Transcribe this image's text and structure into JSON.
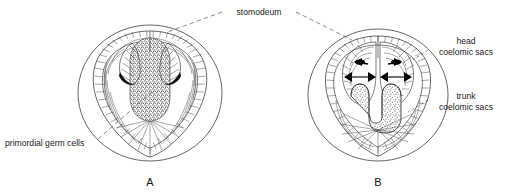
{
  "figure": {
    "background_color": "#ffffff",
    "ink_color": "#2b2b2b"
  },
  "labels": {
    "stomodeum": "stomodeum",
    "primordial_germ_cells": "primordial germ cells",
    "head_coelomic_sacs_line1": "head",
    "head_coelomic_sacs_line2": "coelomic sacs",
    "trunk_coelomic_sacs_line1": "trunk",
    "trunk_coelomic_sacs_line2": "coelomic sacs"
  },
  "panels": [
    {
      "id": "A",
      "caption": "A",
      "description": "earlier stage embryo cross-section with heart-shaped body and stippled primordial germ cell mass",
      "center_x": 150,
      "center_y": 93,
      "outer_radius": 72,
      "labels_attached": [
        "primordial germ cells",
        "stomodeum"
      ]
    },
    {
      "id": "B",
      "caption": "B",
      "description": "later stage embryo cross-section with paired head coelomic sacs and U-shaped trunk coelomic sacs",
      "center_x": 378,
      "center_y": 95,
      "outer_radius": 70,
      "labels_attached": [
        "head coelomic sacs",
        "trunk coelomic sacs",
        "stomodeum"
      ]
    }
  ],
  "leader_lines": [
    {
      "from": "stomodeum",
      "to": "panel-A-apex",
      "style": "dashed"
    },
    {
      "from": "stomodeum",
      "to": "panel-B-apex",
      "style": "dashed"
    },
    {
      "from": "primordial germ cells",
      "to": "panel-A-germ-mass",
      "style": "dashed"
    },
    {
      "from": "head coelomic sacs",
      "to": "panel-B-head-sac",
      "style": "dashed"
    },
    {
      "from": "trunk coelomic sacs",
      "to": "panel-B-trunk-sac",
      "style": "dashed"
    }
  ],
  "markers": {
    "arrow_count": 6,
    "arrow_color": "#000000",
    "description": "black triangular arrowheads indicating expansion of head coelomic sacs"
  }
}
